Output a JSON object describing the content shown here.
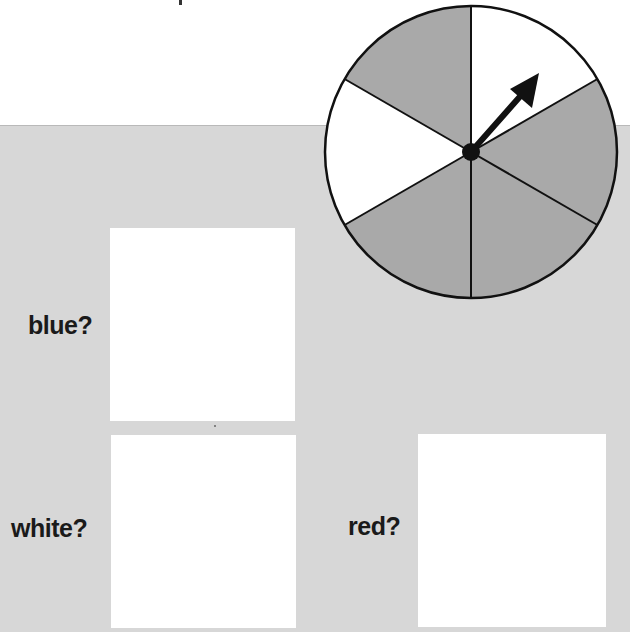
{
  "worksheet": {
    "questions": [
      {
        "label": "blue?",
        "answer": ""
      },
      {
        "label": "white?",
        "answer": ""
      },
      {
        "label": "red?",
        "answer": ""
      }
    ]
  },
  "spinner": {
    "sections": 6,
    "section_colors": [
      "white",
      "gray",
      "gray",
      "gray",
      "white",
      "gray"
    ],
    "arrow_points_to": "white",
    "colors": {
      "gray_section": "#a9a9a9",
      "white_section": "#ffffff",
      "outline": "#111111",
      "panel_background": "#d7d7d7"
    }
  }
}
